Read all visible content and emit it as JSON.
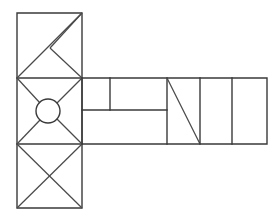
{
  "figure": {
    "title": "Hammer-shaped geometric line drawing",
    "kind": "line-drawing",
    "background_color": "#ffffff",
    "stroke_color": "#3a3a3a",
    "stroke_width": 1.4,
    "canvas": {
      "width": 280,
      "height": 223
    },
    "geometry": {
      "column": {
        "left": 17,
        "right": 82,
        "top": 13,
        "bottom": 208
      },
      "arm": {
        "left": 82,
        "right": 267,
        "top": 78,
        "bottom": 144
      },
      "row_dividers_y": [
        78,
        144
      ],
      "arm_inner_horizontal_y": 110,
      "arm_vertical_x": [
        110,
        167,
        200,
        232
      ],
      "arm_inner_horizontal_span_x": [
        82,
        167
      ],
      "circle": {
        "cx": 48,
        "cy": 111,
        "r": 12
      },
      "k_vertex": {
        "x": 50,
        "y": 48
      }
    },
    "cells": [
      {
        "name": "top-square",
        "x": 17,
        "y": 13,
        "w": 65,
        "h": 65,
        "pattern": "diagonal-plus-k",
        "label": "Top square with rising diagonal and K-notch"
      },
      {
        "name": "middle-square",
        "x": 17,
        "y": 78,
        "w": 65,
        "h": 66,
        "pattern": "circle-with-corner-diagonals",
        "label": "Middle square with central circle and converging corner diagonals"
      },
      {
        "name": "bottom-square",
        "x": 17,
        "y": 144,
        "w": 65,
        "h": 64,
        "pattern": "full-cross",
        "label": "Bottom square with full X diagonals"
      },
      {
        "name": "arm-cell-upper-left",
        "x": 82,
        "y": 78,
        "w": 28,
        "h": 32,
        "pattern": "empty",
        "label": "Arm upper-left blank cell"
      },
      {
        "name": "arm-cell-upper-right",
        "x": 110,
        "y": 78,
        "w": 57,
        "h": 32,
        "pattern": "empty",
        "label": "Arm upper-right blank cell"
      },
      {
        "name": "arm-cell-lower-left",
        "x": 82,
        "y": 110,
        "w": 85,
        "h": 34,
        "pattern": "empty",
        "label": "Arm lower wide blank cell"
      },
      {
        "name": "arm-cell-diagonal",
        "x": 167,
        "y": 78,
        "w": 33,
        "h": 66,
        "pattern": "falling-diagonal",
        "label": "Arm cell with falling diagonal"
      },
      {
        "name": "arm-cell-narrow-a",
        "x": 200,
        "y": 78,
        "w": 32,
        "h": 66,
        "pattern": "empty",
        "label": "Arm narrow blank cell A"
      },
      {
        "name": "arm-cell-narrow-b",
        "x": 232,
        "y": 78,
        "w": 35,
        "h": 66,
        "pattern": "empty",
        "label": "Arm narrow blank cell B"
      }
    ]
  }
}
